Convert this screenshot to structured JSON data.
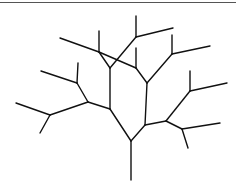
{
  "diagram": {
    "type": "branching-tree",
    "stroke_color": "#111111",
    "border_color": "#555555",
    "segments": [
      [
        131,
        180,
        131,
        141
      ],
      [
        131,
        141,
        110,
        109
      ],
      [
        131,
        141,
        145,
        125
      ],
      [
        110,
        109,
        110,
        68
      ],
      [
        110,
        109,
        88,
        102
      ],
      [
        88,
        102,
        77,
        83
      ],
      [
        88,
        102,
        50,
        115
      ],
      [
        77,
        83,
        78,
        63
      ],
      [
        77,
        83,
        41,
        71
      ],
      [
        50,
        115,
        16,
        103
      ],
      [
        50,
        115,
        40,
        133
      ],
      [
        110,
        68,
        99,
        52
      ],
      [
        110,
        68,
        136,
        37
      ],
      [
        99,
        52,
        99,
        31
      ],
      [
        99,
        52,
        60,
        38
      ],
      [
        99,
        52,
        136,
        68
      ],
      [
        136,
        37,
        136,
        16
      ],
      [
        136,
        37,
        173,
        28
      ],
      [
        145,
        125,
        147,
        83
      ],
      [
        145,
        125,
        166,
        121
      ],
      [
        147,
        83,
        136,
        68
      ],
      [
        147,
        83,
        172,
        54
      ],
      [
        136,
        68,
        136,
        48
      ],
      [
        172,
        54,
        172,
        35
      ],
      [
        172,
        54,
        210,
        46
      ],
      [
        166,
        121,
        190,
        91
      ],
      [
        190,
        91,
        190,
        71
      ],
      [
        190,
        91,
        227,
        83
      ],
      [
        166,
        121,
        182,
        129
      ],
      [
        182,
        129,
        220,
        123
      ],
      [
        182,
        129,
        188,
        148
      ]
    ]
  }
}
